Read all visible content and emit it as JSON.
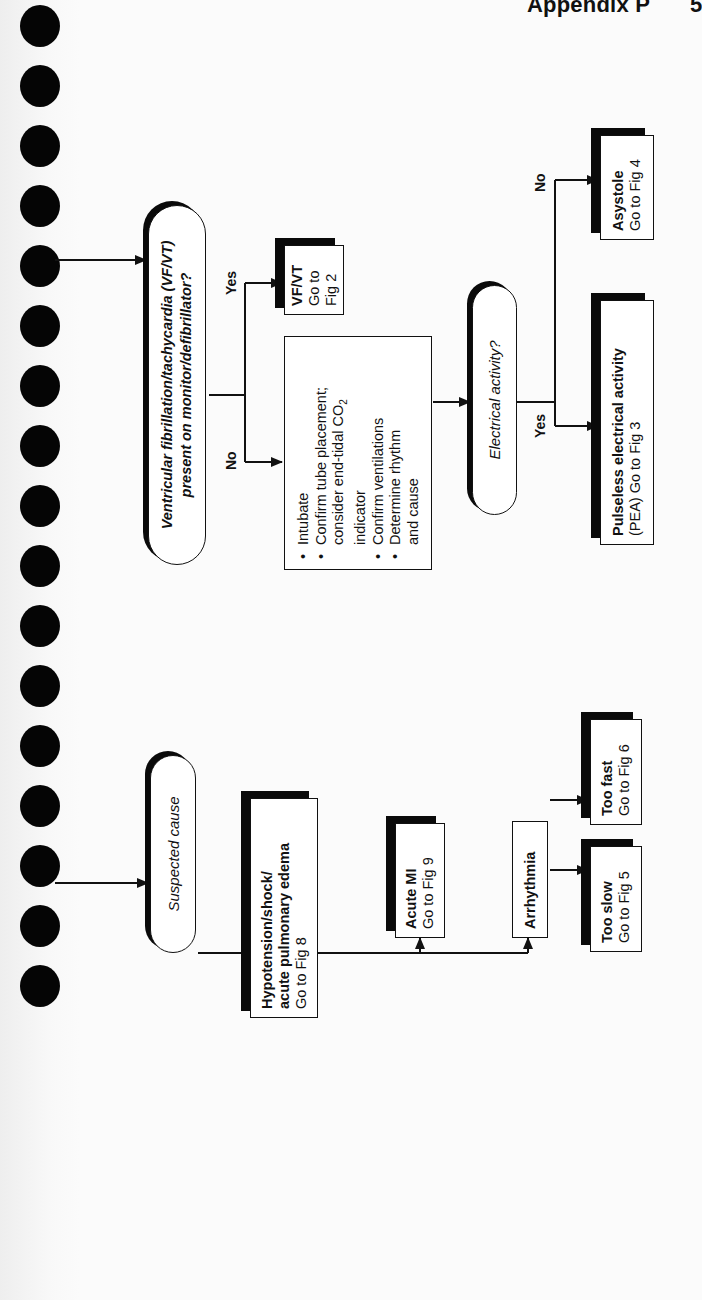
{
  "page": {
    "running_head": "Appendix P",
    "page_number": "5",
    "binding_holes": 17,
    "orientation": "rotated 90° counter-clockwise"
  },
  "colors": {
    "ink": "#111111",
    "paper": "#fbfbfb",
    "shadow": "#0a0a0a"
  },
  "flowchart_top": {
    "decision_vf_vt": {
      "line1": "Ventricular fibrillation/tachycardia (VF/VT)",
      "line2": "present on monitor/defibrillator?"
    },
    "yes_label": "Yes",
    "no_label": "No",
    "vf_vt_box": {
      "title": "VF/VT",
      "sub": "Go to Fig 2"
    },
    "actions_box": {
      "items": [
        {
          "bullet": "•",
          "text": "Intubate"
        },
        {
          "bullet": "•",
          "text": "Confirm tube placement;"
        },
        {
          "bullet": "",
          "text": "consider end-tidal CO"
        },
        {
          "bullet": "",
          "text": "indicator"
        },
        {
          "bullet": "•",
          "text": "Confirm ventilations"
        },
        {
          "bullet": "•",
          "text": "Determine rhythm"
        },
        {
          "bullet": "",
          "text": "and cause"
        }
      ],
      "co2_subscript": "2"
    },
    "decision_electrical": {
      "text": "Electrical activity?"
    },
    "electrical_yes_label": "Yes",
    "electrical_no_label": "No",
    "pea_box": {
      "title": "Pulseless electrical activity",
      "sub": "(PEA) Go to Fig 3"
    },
    "asystole_box": {
      "title": "Asystole",
      "sub": "Go to Fig 4"
    }
  },
  "flowchart_bottom": {
    "suspected_cause": {
      "text": "Suspected cause"
    },
    "hypotension_box": {
      "title_line1": "Hypotension/shock/",
      "title_line2": "acute pulmonary edema",
      "sub": "Go to Fig 8"
    },
    "acute_mi_box": {
      "title": "Acute MI",
      "sub": "Go to Fig 9"
    },
    "arrhythmia_box": {
      "text": "Arrhythmia"
    },
    "too_slow_box": {
      "title": "Too slow",
      "sub": "Go to Fig 5"
    },
    "too_fast_box": {
      "title": "Too fast",
      "sub": "Go to Fig 6"
    }
  }
}
